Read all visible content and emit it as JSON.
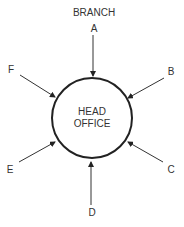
{
  "title": "BRANCH",
  "center": {
    "line1": "HEAD",
    "line2": "OFFICE"
  },
  "branches": [
    {
      "id": "A",
      "label": "A"
    },
    {
      "id": "B",
      "label": "B"
    },
    {
      "id": "C",
      "label": "C"
    },
    {
      "id": "D",
      "label": "D"
    },
    {
      "id": "E",
      "label": "E"
    },
    {
      "id": "F",
      "label": "F"
    }
  ]
}
